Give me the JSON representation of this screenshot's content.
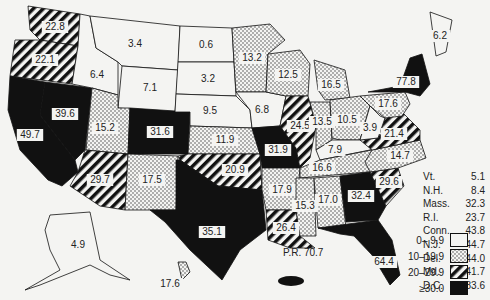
{
  "legend": {
    "bins": [
      {
        "label": "0– 9.9",
        "fill": "white"
      },
      {
        "label": "10–19.9",
        "fill": "dots"
      },
      {
        "label": "20–29.9",
        "fill": "stripes"
      },
      {
        "label": "≥30.0",
        "fill": "black"
      }
    ]
  },
  "states": [
    {
      "id": "WA",
      "value": "22.8"
    },
    {
      "id": "OR",
      "value": "22.1"
    },
    {
      "id": "CA",
      "value": "49.7"
    },
    {
      "id": "NV",
      "value": "39.6"
    },
    {
      "id": "ID",
      "value": "6.4"
    },
    {
      "id": "MT",
      "value": "3.4"
    },
    {
      "id": "WY",
      "value": "7.1"
    },
    {
      "id": "UT",
      "value": "15.2"
    },
    {
      "id": "CO",
      "value": "31.6"
    },
    {
      "id": "AZ",
      "value": "29.7"
    },
    {
      "id": "NM",
      "value": "17.5"
    },
    {
      "id": "ND",
      "value": "0.6"
    },
    {
      "id": "SD",
      "value": "3.2"
    },
    {
      "id": "NE",
      "value": "9.5"
    },
    {
      "id": "KS",
      "value": "11.9"
    },
    {
      "id": "OK",
      "value": "20.9"
    },
    {
      "id": "TX",
      "value": "35.1"
    },
    {
      "id": "MN",
      "value": "13.2"
    },
    {
      "id": "IA",
      "value": "6.8"
    },
    {
      "id": "MO",
      "value": "31.9"
    },
    {
      "id": "AR",
      "value": "17.9"
    },
    {
      "id": "LA",
      "value": "26.4"
    },
    {
      "id": "WI",
      "value": "12.5"
    },
    {
      "id": "IL",
      "value": "24.5"
    },
    {
      "id": "MI",
      "value": "16.5"
    },
    {
      "id": "IN",
      "value": "13.5"
    },
    {
      "id": "OH",
      "value": "10.5"
    },
    {
      "id": "KY",
      "value": "7.9"
    },
    {
      "id": "TN",
      "value": "16.6"
    },
    {
      "id": "MS",
      "value": "15.3"
    },
    {
      "id": "AL",
      "value": "17.0"
    },
    {
      "id": "GA",
      "value": "32.4"
    },
    {
      "id": "FL",
      "value": "64.4"
    },
    {
      "id": "SC",
      "value": "29.6"
    },
    {
      "id": "NC",
      "value": "14.7"
    },
    {
      "id": "VA",
      "value": "21.4"
    },
    {
      "id": "WV",
      "value": "3.9"
    },
    {
      "id": "PA",
      "value": "17.6"
    },
    {
      "id": "NY",
      "value": "77.8"
    },
    {
      "id": "ME",
      "value": "6.2"
    },
    {
      "id": "AK",
      "value": "4.9"
    },
    {
      "id": "HI",
      "value": "17.6"
    }
  ],
  "small_states": [
    {
      "label": "Vt.",
      "value": "5.1"
    },
    {
      "label": "N.H.",
      "value": "8.4"
    },
    {
      "label": "Mass.",
      "value": "32.3"
    },
    {
      "label": "R.I.",
      "value": "23.7"
    },
    {
      "label": "Conn.",
      "value": "43.8"
    },
    {
      "label": "N.J.",
      "value": "44.7"
    },
    {
      "label": "Del.",
      "value": "44.0"
    },
    {
      "label": "Md.",
      "value": "41.7"
    },
    {
      "label": "D.C.",
      "value": "183.6"
    }
  ],
  "puerto_rico": {
    "label": "P.R.",
    "value": "70.7"
  }
}
